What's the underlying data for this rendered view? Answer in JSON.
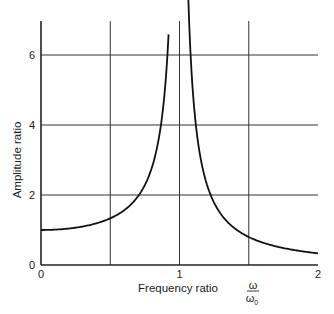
{
  "chart_data": {
    "type": "line",
    "title": "",
    "xlabel": "Frequency ratio",
    "xlabel_symbol_num": "ω",
    "xlabel_symbol_den": "ω",
    "xlabel_symbol_den_sub": "0",
    "ylabel": "Amplitude ratio",
    "xlim": [
      0,
      2
    ],
    "ylim": [
      0,
      7
    ],
    "x_ticks": [
      "0",
      "1",
      "2"
    ],
    "y_ticks": [
      "0",
      "2",
      "4",
      "6"
    ],
    "grid": true,
    "legend": null,
    "series": [
      {
        "name": "Amplitude ratio (undamped)",
        "formula": "1/|1-r^2|",
        "x": [
          0,
          0.2,
          0.4,
          0.5,
          0.6,
          0.7,
          0.8,
          0.85,
          0.9,
          0.92,
          1.04,
          1.06,
          1.1,
          1.2,
          1.3,
          1.4,
          1.5,
          1.6,
          1.8,
          2.0
        ],
        "y": [
          1.0,
          1.04,
          1.19,
          1.33,
          1.56,
          1.96,
          2.78,
          3.6,
          5.26,
          6.4,
          6.4,
          5.6,
          4.76,
          2.27,
          1.45,
          1.04,
          0.8,
          0.64,
          0.45,
          0.33
        ]
      }
    ]
  }
}
